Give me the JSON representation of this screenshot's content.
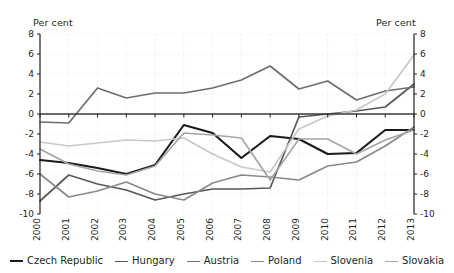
{
  "axes": {
    "left_title": "Per cent",
    "right_title": "Per cent",
    "y_ticks": [
      "8",
      "6",
      "4",
      "2",
      "0",
      "-2",
      "-4",
      "-6",
      "-8",
      "-10"
    ],
    "x_ticks": [
      "2000",
      "2001",
      "2002",
      "2003",
      "2004",
      "2005",
      "2006",
      "2007",
      "2008",
      "2009",
      "2010",
      "2011",
      "2012",
      "2013"
    ]
  },
  "legend": {
    "items": [
      {
        "label": "Czech Republic",
        "color": "#1a1a1a",
        "width": 2.1
      },
      {
        "label": "Hungary",
        "color": "#585858",
        "width": 1.7
      },
      {
        "label": "Austria",
        "color": "#6e6e6e",
        "width": 1.7
      },
      {
        "label": "Poland",
        "color": "#8a8a8a",
        "width": 1.7
      },
      {
        "label": "Slovenia",
        "color": "#c8c8c8",
        "width": 1.7
      },
      {
        "label": "Slovakia",
        "color": "#a5a5a5",
        "width": 1.7
      }
    ]
  },
  "chart_data": {
    "type": "line",
    "title": "",
    "xlabel": "",
    "ylabel": "Per cent",
    "ylim": [
      -10,
      8
    ],
    "ytick_step": 2,
    "grid": true,
    "legend_position": "bottom",
    "dual_axis": true,
    "x": [
      "2000",
      "2001",
      "2002",
      "2003",
      "2004",
      "2005",
      "2006",
      "2007",
      "2008",
      "2009",
      "2010",
      "2011",
      "2012",
      "2013"
    ],
    "series": [
      {
        "name": "Czech Republic",
        "color": "#1a1a1a",
        "values": [
          -4.6,
          -4.9,
          -5.4,
          -6.0,
          -5.1,
          -1.1,
          -1.9,
          -4.4,
          -2.2,
          -2.5,
          -4.0,
          -3.9,
          -1.6,
          -1.6
        ]
      },
      {
        "name": "Hungary",
        "color": "#585858",
        "values": [
          -8.7,
          -6.1,
          -7.0,
          -7.6,
          -8.6,
          -8.0,
          -7.5,
          -7.5,
          -7.4,
          -0.3,
          0.0,
          0.3,
          0.7,
          3.0
        ]
      },
      {
        "name": "Austria",
        "color": "#6e6e6e",
        "values": [
          -0.8,
          -0.9,
          2.6,
          1.6,
          2.1,
          2.1,
          2.6,
          3.4,
          4.8,
          2.5,
          3.3,
          1.4,
          2.3,
          2.7
        ]
      },
      {
        "name": "Poland",
        "color": "#8a8a8a",
        "values": [
          -6.0,
          -8.3,
          -7.7,
          -6.8,
          -8.0,
          -8.6,
          -6.9,
          -6.1,
          -6.3,
          -6.6,
          -5.2,
          -4.8,
          -3.2,
          -1.3
        ]
      },
      {
        "name": "Slovenia",
        "color": "#c8c8c8",
        "values": [
          -2.8,
          -3.2,
          -2.9,
          -2.6,
          -2.7,
          -2.4,
          -4.0,
          -5.3,
          -5.8,
          -1.5,
          -0.2,
          0.4,
          2.0,
          5.9
        ]
      },
      {
        "name": "Slovakia",
        "color": "#a5a5a5",
        "values": [
          -3.5,
          -5.0,
          -5.7,
          -6.1,
          -5.2,
          -1.9,
          -2.1,
          -2.4,
          -6.6,
          -2.5,
          -2.5,
          -4.0,
          -2.6,
          -1.6
        ]
      }
    ]
  }
}
